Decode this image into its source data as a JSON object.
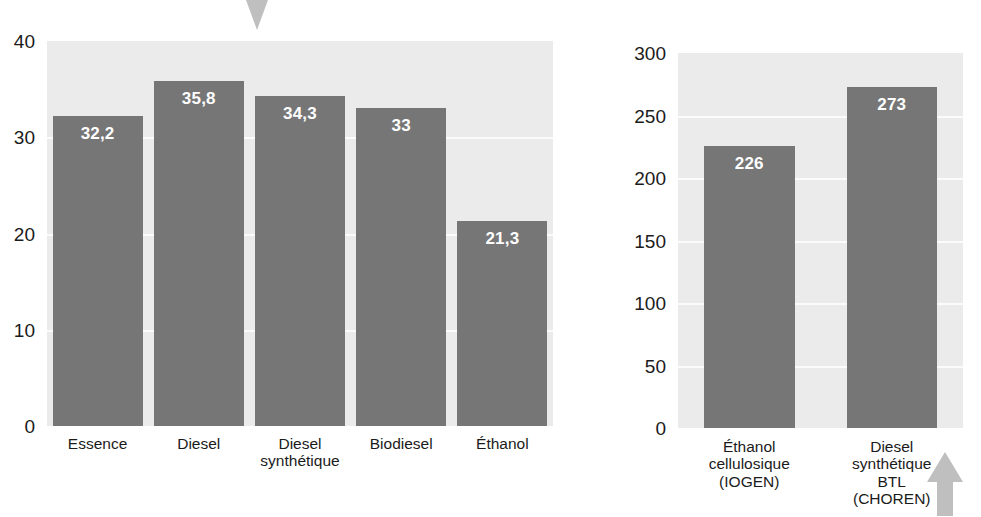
{
  "figure": {
    "background_color": "#ffffff",
    "bar_color": "#767676",
    "plot_background_color": "#ebebec",
    "gridline_color": "#fbfbfb",
    "value_label_color": "#ffffff",
    "tick_label_color": "#1b1b1b",
    "arrow_color": "#bfbfbf",
    "arrow_down_name": "arrow-down-icon",
    "arrow_up_name": "arrow-up-icon"
  },
  "chart_data": [
    {
      "type": "bar",
      "title": "",
      "xlabel": "",
      "ylabel": "",
      "ylim": [
        0,
        40
      ],
      "yticks": [
        0,
        10,
        20,
        30,
        40
      ],
      "ytick_labels": [
        "0",
        "10",
        "20",
        "30",
        "40"
      ],
      "grid": true,
      "legend": "none",
      "categories": [
        "Essence",
        "Diesel",
        "Diesel\nsynthétique",
        "Biodiesel",
        "Éthanol"
      ],
      "values": [
        32.2,
        35.8,
        34.3,
        33,
        21.3
      ],
      "value_labels": [
        "32,2",
        "35,8",
        "34,3",
        "33",
        "21,3"
      ]
    },
    {
      "type": "bar",
      "title": "",
      "xlabel": "",
      "ylabel": "",
      "ylim": [
        0,
        300
      ],
      "yticks": [
        0,
        50,
        100,
        150,
        200,
        250,
        300
      ],
      "ytick_labels": [
        "0",
        "50",
        "100",
        "150",
        "200",
        "250",
        "300"
      ],
      "grid": true,
      "legend": "none",
      "categories": [
        "Éthanol\ncellulosique\n(IOGEN)",
        "Diesel\nsynthétique\nBTL\n(CHOREN)"
      ],
      "values": [
        226,
        273
      ],
      "value_labels": [
        "226",
        "273"
      ]
    }
  ]
}
